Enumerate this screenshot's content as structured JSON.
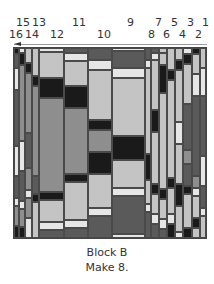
{
  "figure": {
    "title": "Block B",
    "subtitle": "Make 8.",
    "column_numbers": [
      {
        "label": "15",
        "x": 16,
        "y": 17
      },
      {
        "label": "13",
        "x": 32,
        "y": 17
      },
      {
        "label": "11",
        "x": 72,
        "y": 17
      },
      {
        "label": "9",
        "x": 127,
        "y": 17
      },
      {
        "label": "7",
        "x": 155,
        "y": 17
      },
      {
        "label": "5",
        "x": 171,
        "y": 17
      },
      {
        "label": "3",
        "x": 187,
        "y": 17
      },
      {
        "label": "1",
        "x": 202,
        "y": 17
      },
      {
        "label": "16",
        "x": 9,
        "y": 29
      },
      {
        "label": "14",
        "x": 25,
        "y": 29
      },
      {
        "label": "12",
        "x": 50,
        "y": 29
      },
      {
        "label": "10",
        "x": 97,
        "y": 29
      },
      {
        "label": "8",
        "x": 148,
        "y": 29
      },
      {
        "label": "6",
        "x": 163,
        "y": 29
      },
      {
        "label": "4",
        "x": 179,
        "y": 29
      },
      {
        "label": "2",
        "x": 195,
        "y": 29
      }
    ],
    "sewing_direction": "right-to-left",
    "palette": {
      "black": "#1a1a1a",
      "dark": "#5a5a5a",
      "medium": "#8e8e8e",
      "light": "#c4c4c4",
      "pale": "#e6e6e6"
    }
  }
}
